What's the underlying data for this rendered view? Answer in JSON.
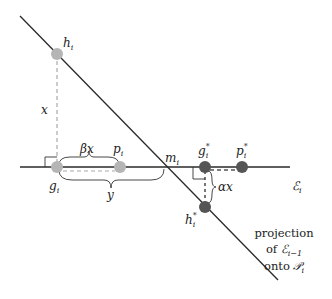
{
  "diagram": {
    "labels": {
      "h_i": "h",
      "h_i_sub": "i",
      "x": "x",
      "beta_x": "βx",
      "p_i": "p",
      "p_i_sub": "i",
      "m_i": "m",
      "m_i_sub": "i",
      "g_i": "g",
      "g_i_sub": "i",
      "y": "y",
      "g_star": "g",
      "g_star_sup": "*",
      "g_star_sub": "i",
      "p_star": "p",
      "p_star_sup": "*",
      "p_star_sub": "i",
      "alpha_x": "αx",
      "h_star": "h",
      "h_star_sup": "*",
      "h_star_sub": "i",
      "E_i": "ℰ",
      "E_i_sub": "i"
    },
    "caption": {
      "line1": "projection",
      "line2_prefix": "of ",
      "line2_sym": "ℰ",
      "line2_sub": "i−1",
      "line3_prefix": "onto ",
      "line3_sym": "𝒫",
      "line3_sub": "i"
    },
    "colors": {
      "line": "#2a2a2a",
      "light_point": "#b5b5b5",
      "dark_point": "#555555",
      "dashed_light": "#aaaaaa",
      "dashed_dark": "#555555"
    }
  }
}
